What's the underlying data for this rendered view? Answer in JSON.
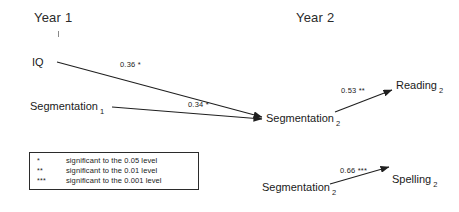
{
  "headings": {
    "year1": "Year 1",
    "year2": "Year 2"
  },
  "nodes": {
    "iq": {
      "label": "IQ",
      "subscript": ""
    },
    "segmentation1": {
      "label": "Segmentation",
      "subscript": "1"
    },
    "segmentation2_mid": {
      "label": "Segmentation",
      "subscript": "2"
    },
    "reading2": {
      "label": "Reading",
      "subscript": "2"
    },
    "segmentation2_bottom": {
      "label": "Segmentation",
      "subscript": "2"
    },
    "spelling2": {
      "label": "Spelling",
      "subscript": "2"
    }
  },
  "paths": {
    "iq_to_segmentation2": "0.36 *",
    "segmentation1_to_segmentation2": "0.34 *",
    "segmentation2_to_reading2": "0.53 **",
    "segmentation2_to_spelling2": "0.66 ***"
  },
  "legend": {
    "rows": [
      {
        "stars": "*",
        "text": "significant to the 0.05 level"
      },
      {
        "stars": "**",
        "text": "significant to the 0.01 level"
      },
      {
        "stars": "***",
        "text": "significant to the 0.001 level"
      }
    ]
  },
  "colors": {
    "ink": "#1a1a1a",
    "line": "#1f1f1f",
    "background": "#ffffff"
  }
}
